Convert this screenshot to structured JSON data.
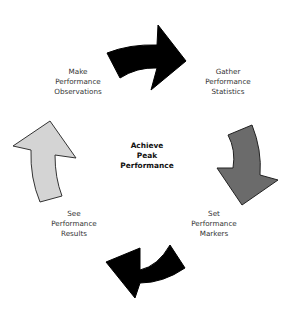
{
  "diagram": {
    "type": "cycle",
    "center": {
      "lines": [
        "Achieve",
        "Peak",
        "Performance"
      ]
    },
    "steps": [
      {
        "id": "gather",
        "lines": [
          "Gather",
          "Performance",
          "Statistics"
        ]
      },
      {
        "id": "set",
        "lines": [
          "Set",
          "Performance",
          "Markers"
        ]
      },
      {
        "id": "see",
        "lines": [
          "See",
          "Performance",
          "Results"
        ]
      },
      {
        "id": "make",
        "lines": [
          "Make",
          "Performance",
          "Observations"
        ]
      }
    ],
    "arrows": [
      {
        "id": "top",
        "direction": "right",
        "fill": "#000000",
        "from": "make",
        "to": "gather"
      },
      {
        "id": "right",
        "direction": "down",
        "fill": "#6b6b6b",
        "from": "gather",
        "to": "set"
      },
      {
        "id": "bottom",
        "direction": "left",
        "fill": "#000000",
        "from": "set",
        "to": "see"
      },
      {
        "id": "left",
        "direction": "up",
        "fill": "#d4d4d4",
        "from": "see",
        "to": "make"
      }
    ]
  }
}
